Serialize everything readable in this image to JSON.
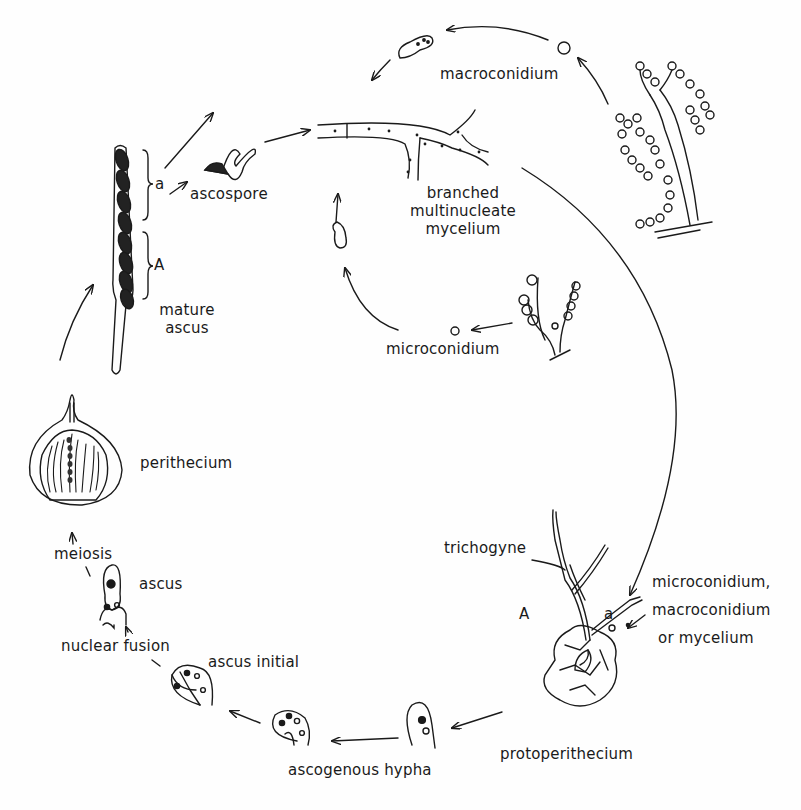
{
  "diagram": {
    "labels": {
      "macroconidium": "macroconidium",
      "ascospore": "ascospore",
      "mycelium_1": "branched",
      "mycelium_2": "multinucleate",
      "mycelium_3": "mycelium",
      "mature_ascus_1": "mature",
      "mature_ascus_2": "ascus",
      "microconidium": "microconidium",
      "perithecium": "perithecium",
      "meiosis": "meiosis",
      "ascus": "ascus",
      "nuclear_fusion": "nuclear fusion",
      "ascus_initial": "ascus initial",
      "ascogenous_hypha": "ascogenous hypha",
      "protoperithecium": "protoperithecium",
      "trichogyne": "trichogyne",
      "fertilizer_1": "microconidium,",
      "fertilizer_2": "macroconidium",
      "fertilizer_3": "or mycelium",
      "mating_A_ascus": "A",
      "mating_a_ascus": "a",
      "mating_A_proto": "A",
      "mating_a_proto": "a"
    },
    "colors": {
      "ink": "#1a1a1a",
      "background": "#fefefe"
    }
  }
}
